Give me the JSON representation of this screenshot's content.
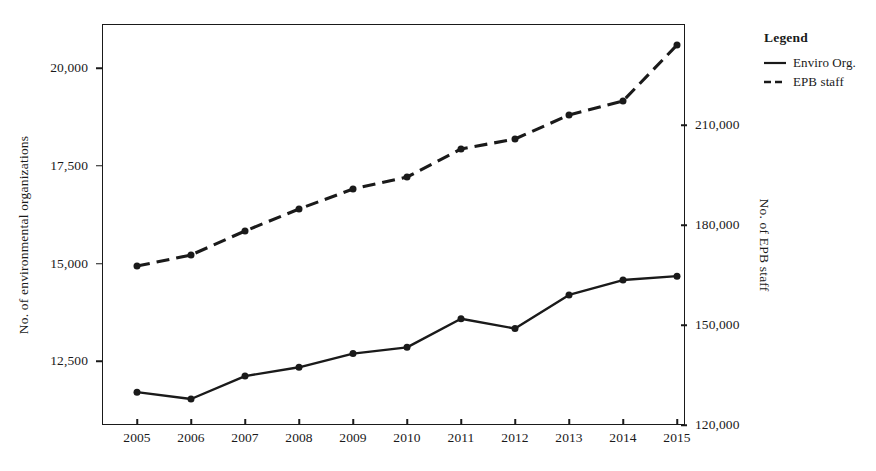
{
  "chart_data": {
    "type": "line",
    "title": "",
    "xlabel": "",
    "categories": [
      "2005",
      "2006",
      "2007",
      "2008",
      "2009",
      "2010",
      "2011",
      "2012",
      "2013",
      "2014",
      "2015"
    ],
    "grid": false,
    "legend": {
      "title": "Legend",
      "position": "right",
      "entries": [
        {
          "name": "Enviro Org.",
          "style": "solid",
          "marker": "filled-circle",
          "color": "#1a1a1a"
        },
        {
          "name": "EPB staff",
          "style": "dashed",
          "marker": "filled-circle",
          "color": "#1a1a1a"
        }
      ]
    },
    "axes": {
      "left": {
        "ylabel": "No. of environmental organizations",
        "ticks": [
          "12,500",
          "15,000",
          "17,500",
          "20,000"
        ],
        "tick_values": [
          12500,
          15000,
          17500,
          20000
        ],
        "ylim": [
          10875,
          21125
        ]
      },
      "right": {
        "ylabel": "No. of EPB staff",
        "ticks": [
          "120,000",
          "150,000",
          "180,000",
          "210,000"
        ],
        "tick_values": [
          120000,
          150000,
          180000,
          210000
        ],
        "ylim": [
          120000,
          240300
        ]
      }
    },
    "series": [
      {
        "name": "Enviro Org.",
        "axis": "left",
        "style": "solid",
        "values": [
          11715,
          11540,
          12125,
          12350,
          12700,
          12860,
          13590,
          13340,
          14200,
          14580,
          14680
        ]
      },
      {
        "name": "EPB staff",
        "axis": "right",
        "style": "dashed",
        "values": [
          167700,
          171000,
          178200,
          184800,
          190800,
          194400,
          202800,
          205800,
          213000,
          217200,
          234000
        ]
      }
    ]
  }
}
